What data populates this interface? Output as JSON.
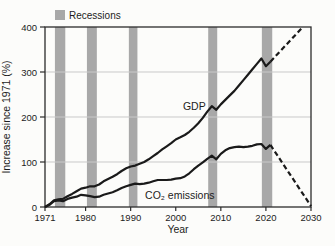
{
  "figure": {
    "background": "#fcfcfa",
    "line_color": "#1a1a1a",
    "recession_color": "#a8a8a8",
    "grid_color": "#c9c9c9",
    "border_color": "#2b2b2b",
    "legend": {
      "label": "Recessions",
      "swatch_color": "#a8a8a8"
    }
  },
  "chart_data": {
    "type": "line",
    "title": "",
    "xlabel": "Year",
    "ylabel": "Increase since 1971 (%)",
    "xlim": [
      1971,
      2030
    ],
    "ylim": [
      0,
      400
    ],
    "x_ticks": [
      1971,
      1980,
      1990,
      2000,
      2010,
      2020,
      2030
    ],
    "y_ticks": [
      0,
      100,
      200,
      300,
      400
    ],
    "grid": "horizontal",
    "legend_position": "top-left",
    "recessions": [
      [
        1973.2,
        1975.5
      ],
      [
        1980.3,
        1982.5
      ],
      [
        1989.6,
        1991.5
      ],
      [
        2007.2,
        2009.2
      ],
      [
        2019.1,
        2021.4
      ]
    ],
    "series": [
      {
        "name": "GDP",
        "style": "solid",
        "points": [
          [
            1971,
            0
          ],
          [
            1972,
            6
          ],
          [
            1973,
            15
          ],
          [
            1974,
            17
          ],
          [
            1975,
            18
          ],
          [
            1976,
            24
          ],
          [
            1977,
            29
          ],
          [
            1978,
            35
          ],
          [
            1979,
            41
          ],
          [
            1980,
            43
          ],
          [
            1981,
            46
          ],
          [
            1982,
            46
          ],
          [
            1983,
            50
          ],
          [
            1984,
            57
          ],
          [
            1985,
            62
          ],
          [
            1986,
            67
          ],
          [
            1987,
            73
          ],
          [
            1988,
            80
          ],
          [
            1989,
            86
          ],
          [
            1990,
            90
          ],
          [
            1991,
            92
          ],
          [
            1992,
            96
          ],
          [
            1993,
            100
          ],
          [
            1994,
            106
          ],
          [
            1995,
            113
          ],
          [
            1996,
            120
          ],
          [
            1997,
            128
          ],
          [
            1998,
            135
          ],
          [
            1999,
            142
          ],
          [
            2000,
            150
          ],
          [
            2001,
            155
          ],
          [
            2002,
            160
          ],
          [
            2003,
            167
          ],
          [
            2004,
            176
          ],
          [
            2005,
            186
          ],
          [
            2006,
            198
          ],
          [
            2007,
            212
          ],
          [
            2008,
            224
          ],
          [
            2009,
            216
          ],
          [
            2010,
            228
          ],
          [
            2011,
            238
          ],
          [
            2012,
            248
          ],
          [
            2013,
            258
          ],
          [
            2014,
            270
          ],
          [
            2015,
            282
          ],
          [
            2016,
            294
          ],
          [
            2017,
            306
          ],
          [
            2018,
            318
          ],
          [
            2019,
            330
          ],
          [
            2020,
            313
          ],
          [
            2021,
            323
          ]
        ]
      },
      {
        "name": "GDP projection",
        "style": "dashed",
        "points": [
          [
            2021,
            323
          ],
          [
            2028.2,
            400
          ]
        ]
      },
      {
        "name": "CO₂ emissions",
        "style": "solid",
        "points": [
          [
            1971,
            0
          ],
          [
            1972,
            5
          ],
          [
            1973,
            13
          ],
          [
            1974,
            15
          ],
          [
            1975,
            13
          ],
          [
            1976,
            18
          ],
          [
            1977,
            21
          ],
          [
            1978,
            23
          ],
          [
            1979,
            27
          ],
          [
            1980,
            26
          ],
          [
            1981,
            24
          ],
          [
            1982,
            22
          ],
          [
            1983,
            23
          ],
          [
            1984,
            27
          ],
          [
            1985,
            30
          ],
          [
            1986,
            33
          ],
          [
            1987,
            37
          ],
          [
            1988,
            42
          ],
          [
            1989,
            46
          ],
          [
            1990,
            49
          ],
          [
            1991,
            52
          ],
          [
            1992,
            51
          ],
          [
            1993,
            52
          ],
          [
            1994,
            54
          ],
          [
            1995,
            57
          ],
          [
            1996,
            60
          ],
          [
            1997,
            60
          ],
          [
            1998,
            60
          ],
          [
            1999,
            61
          ],
          [
            2000,
            63
          ],
          [
            2001,
            64
          ],
          [
            2002,
            68
          ],
          [
            2003,
            75
          ],
          [
            2004,
            84
          ],
          [
            2005,
            92
          ],
          [
            2006,
            99
          ],
          [
            2007,
            107
          ],
          [
            2008,
            114
          ],
          [
            2009,
            106
          ],
          [
            2010,
            118
          ],
          [
            2011,
            126
          ],
          [
            2012,
            131
          ],
          [
            2013,
            133
          ],
          [
            2014,
            134
          ],
          [
            2015,
            133
          ],
          [
            2016,
            134
          ],
          [
            2017,
            136
          ],
          [
            2018,
            139
          ],
          [
            2019,
            140
          ],
          [
            2020,
            129
          ],
          [
            2021,
            138
          ]
        ]
      },
      {
        "name": "CO₂ emissions projection",
        "style": "dashed",
        "points": [
          [
            2021,
            138
          ],
          [
            2030,
            2
          ]
        ]
      }
    ],
    "annotations": [
      {
        "text": "GDP",
        "x": 2001.6,
        "y": 215
      },
      {
        "text": "CO₂ emissions",
        "x": 1993.2,
        "y": 18
      }
    ]
  }
}
